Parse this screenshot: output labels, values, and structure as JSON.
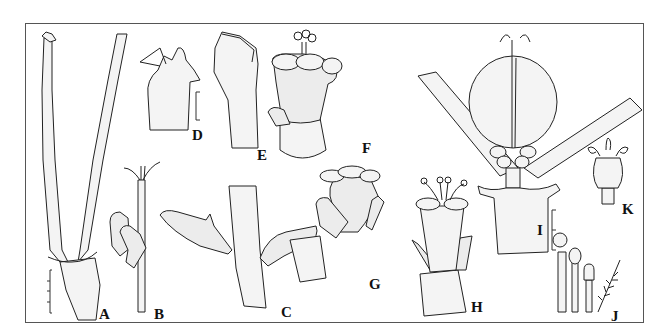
{
  "figure": {
    "type": "botanical-illustration-plate",
    "panel_count": 11,
    "panels": [
      {
        "id": "A",
        "label": "A",
        "subject": "forked stems with nodal sheath",
        "scale_bar": "ticked, 5 divisions"
      },
      {
        "id": "B",
        "label": "B",
        "subject": "stem tip with bifid apex and lobed leaf"
      },
      {
        "id": "C",
        "label": "C",
        "subject": "stem node with two opposite leaves"
      },
      {
        "id": "D",
        "label": "D",
        "subject": "leaf sheath apex, lateral view",
        "scale_bar": "single bracket"
      },
      {
        "id": "E",
        "label": "E",
        "subject": "leaf sheath apex, front view"
      },
      {
        "id": "F",
        "label": "F",
        "subject": "flower with exserted style"
      },
      {
        "id": "G",
        "label": "G",
        "subject": "flower with subtending bract"
      },
      {
        "id": "H",
        "label": "H",
        "subject": "flower with stigmas exserted, in sheath"
      },
      {
        "id": "I",
        "label": "I",
        "subject": "fruit (capsule) between leaves",
        "scale_bar": "bracket with midpoint tick"
      },
      {
        "id": "J",
        "label": "J",
        "subject": "stamens, staminode and hair"
      },
      {
        "id": "K",
        "label": "K",
        "subject": "pistil with recurved stigmas"
      }
    ],
    "colors": {
      "ink": "#222222",
      "background": "#ffffff",
      "frame": "#555555"
    }
  }
}
